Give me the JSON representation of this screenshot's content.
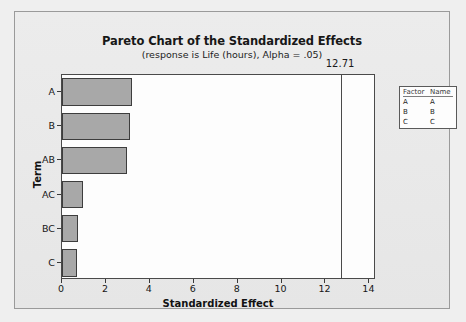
{
  "chart_data": {
    "type": "bar",
    "orientation": "horizontal",
    "title": "Pareto Chart of the Standardized Effects",
    "subtitle": "(response is Life (hours), Alpha = .05)",
    "xlabel": "Standardized Effect",
    "ylabel": "Term",
    "categories": [
      "A",
      "B",
      "AB",
      "AC",
      "BC",
      "C"
    ],
    "values": [
      3.2,
      3.1,
      2.95,
      0.95,
      0.73,
      0.68
    ],
    "xlim": [
      0,
      14.3
    ],
    "xticks": [
      0,
      2,
      4,
      6,
      8,
      10,
      12,
      14
    ],
    "xticklabels": [
      "0",
      "2",
      "4",
      "6",
      "8",
      "10",
      "12",
      "14"
    ],
    "grid": false,
    "reference_line": {
      "value": 12.71,
      "label": "12.71"
    },
    "bar_color": "#a8a8a8",
    "bar_edge_color": "#3d3d3d",
    "plot_background": "#fdfdfd",
    "page_background": "#e9e9e9"
  },
  "legend": {
    "headers": [
      "Factor",
      "Name"
    ],
    "rows": [
      {
        "factor": "A",
        "name": "A"
      },
      {
        "factor": "B",
        "name": "B"
      },
      {
        "factor": "C",
        "name": "C"
      }
    ]
  }
}
